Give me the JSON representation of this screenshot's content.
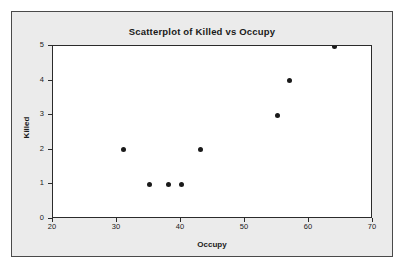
{
  "chart_data": {
    "type": "scatter",
    "title": "Scatterplot of Killed vs Occupy",
    "xlabel": "Occupy",
    "ylabel": "Killed",
    "xlim": [
      20,
      70
    ],
    "ylim": [
      0,
      5
    ],
    "xticks": [
      20,
      30,
      40,
      50,
      60,
      70
    ],
    "yticks": [
      0,
      1,
      2,
      3,
      4,
      5
    ],
    "grid": false,
    "legend": null,
    "marker": {
      "shape": "circle",
      "color": "#1a1a1a",
      "size": 5
    },
    "points": [
      {
        "x": 24,
        "y": 0
      },
      {
        "x": 31,
        "y": 2
      },
      {
        "x": 33,
        "y": 0
      },
      {
        "x": 34,
        "y": 0
      },
      {
        "x": 35,
        "y": 1
      },
      {
        "x": 38,
        "y": 1
      },
      {
        "x": 40,
        "y": 1
      },
      {
        "x": 43,
        "y": 2
      },
      {
        "x": 43,
        "y": 0
      },
      {
        "x": 50,
        "y": 0
      },
      {
        "x": 55,
        "y": 3
      },
      {
        "x": 57,
        "y": 4
      },
      {
        "x": 64,
        "y": 5
      }
    ]
  },
  "colors": {
    "panel_background": "#ebebeb",
    "plot_background": "#ffffff",
    "axis": "#2b2b2b",
    "text": "#1a1a1a",
    "frame": "#4a4a4a"
  }
}
